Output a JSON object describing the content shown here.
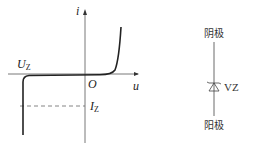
{
  "figure": {
    "iv_curve": {
      "y_axis_label": "i",
      "x_axis_label": "u",
      "origin_label": "O",
      "breakdown_voltage_label": {
        "main": "U",
        "sub": "Z"
      },
      "zener_current_label": {
        "main": "I",
        "sub": "Z"
      }
    },
    "symbol": {
      "top_label": "阴极",
      "bottom_label": "阳极",
      "component_label": "VZ"
    },
    "colors": {
      "line": "#222222",
      "dash": "#666666"
    }
  }
}
